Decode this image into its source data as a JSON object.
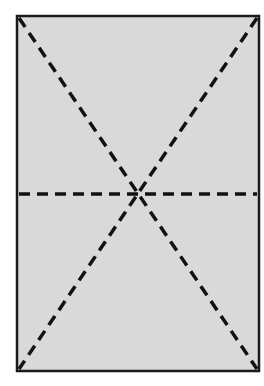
{
  "diagram": {
    "background": "#ffffff",
    "rectangle": {
      "x": 17,
      "y": 16,
      "width": 242,
      "height": 355,
      "fill": "#d9d9d9",
      "stroke": "#1a1a1a",
      "stroke_width": 2.5
    },
    "lines": [
      {
        "name": "diagonal-top-left-to-bottom-right",
        "x1": 19,
        "y1": 18,
        "x2": 257,
        "y2": 369
      },
      {
        "name": "diagonal-top-right-to-bottom-left",
        "x1": 257,
        "y1": 18,
        "x2": 19,
        "y2": 369
      },
      {
        "name": "horizontal-midline",
        "x1": 19,
        "y1": 194,
        "x2": 257,
        "y2": 194
      }
    ],
    "line_style": {
      "stroke": "#111111",
      "stroke_width": 3.5,
      "dash": "11 7"
    },
    "intersection": {
      "x": 138,
      "y": 193
    }
  }
}
